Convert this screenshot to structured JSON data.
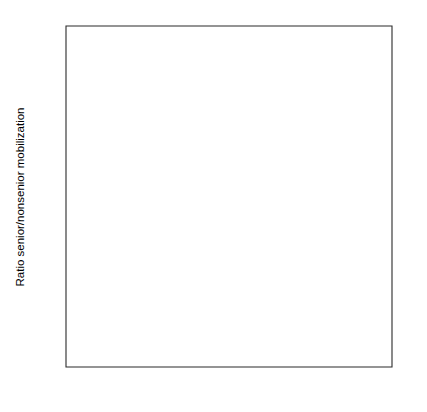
{
  "chart_data": {
    "type": "line",
    "title": "",
    "subtitle": "",
    "xlabel": "",
    "ylabel": "Ratio senior/nonsenior mobilization",
    "xlim": [
      1950,
      2000
    ],
    "ylim": [
      0.4,
      2.2
    ],
    "xticks": [
      1950,
      1960,
      1970,
      1980,
      1990,
      2000
    ],
    "xtick_labels": [
      "1950",
      "1960",
      "1970",
      "1980",
      "1990",
      "2000"
    ],
    "yticks": [
      0.4,
      0.6,
      0.8,
      1.0,
      1.2,
      1.4,
      1.6,
      1.8,
      2.0,
      2.2
    ],
    "ytick_labels": [
      "0.4",
      "0.6",
      "0.8",
      "1",
      "1.2",
      "1.4",
      "1.6",
      "1.8",
      "2",
      "2.2"
    ],
    "grid": false,
    "legend_position": "top-left",
    "reference_lines": [
      {
        "axis": "y",
        "value": 1.0,
        "style": "solid",
        "color": "#555555"
      }
    ],
    "x": [
      1956,
      1958,
      1960,
      1962,
      1964,
      1966,
      1968,
      1970,
      1972,
      1974,
      1976,
      1978,
      1980,
      1982,
      1984,
      1986,
      1988,
      1990,
      1992,
      1994,
      1996
    ],
    "series": [
      {
        "name": "Democratic party",
        "style": "dotted",
        "color": "#000000",
        "values": [
          0.87,
          0.74,
          0.67,
          0.8,
          0.93,
          0.76,
          0.82,
          0.91,
          1.05,
          0.86,
          1.14,
          1.25,
          1.2,
          0.97,
          1.31,
          1.41,
          1.55,
          1.7,
          1.18,
          1.23,
          1.53
        ]
      },
      {
        "name": "Republican party",
        "style": "dashed",
        "color": "#000000",
        "values": [
          0.91,
          0.74,
          0.62,
          0.63,
          0.65,
          0.7,
          0.64,
          0.79,
          1.0,
          0.95,
          1.23,
          1.1,
          1.18,
          1.11,
          1.1,
          1.58,
          1.44,
          1.57,
          1.36,
          1.19,
          1.46
        ]
      },
      {
        "name": "Both parties",
        "style": "solid",
        "color": "#000000",
        "values": [
          0.71,
          0.62,
          0.51,
          0.63,
          0.65,
          0.82,
          0.61,
          0.9,
          1.41,
          0.67,
          1.34,
          1.18,
          0.94,
          1.14,
          1.35,
          1.77,
          1.88,
          1.98,
          1.66,
          1.32,
          2.04
        ]
      }
    ],
    "legend_entries": [
      {
        "label": "Democratic party",
        "style": "dotted"
      },
      {
        "label": "Republican party",
        "style": "dashed"
      },
      {
        "label": "Both parties",
        "style": "solid"
      }
    ]
  },
  "plot_geometry": {
    "left": 66,
    "right": 392,
    "top": 26,
    "bottom": 367
  }
}
